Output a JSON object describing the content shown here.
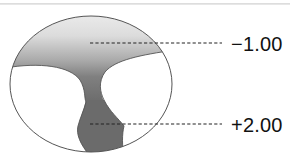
{
  "diagram": {
    "type": "progressive-lens-power-map",
    "labels": {
      "distance_power": "−1.00",
      "near_power": "+2.00"
    },
    "colors": {
      "outline": "#555555",
      "distance_zone_light": "#ededed",
      "corridor_mid": "#9a9a9a",
      "near_zone_dark": "#6a6a6a",
      "background": "#ffffff",
      "leader_line": "#222222"
    }
  }
}
